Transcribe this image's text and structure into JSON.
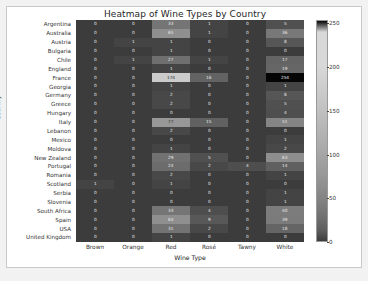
{
  "chart_data": {
    "type": "heatmap",
    "title": "Heatmap of Wine Types by Country",
    "xlabel": "Wine Type",
    "ylabel": "Country",
    "categories_x": [
      "Brown",
      "Orange",
      "Red",
      "Rosé",
      "Tawny",
      "White"
    ],
    "categories_y": [
      "Argentina",
      "Australia",
      "Austria",
      "Bulgaria",
      "Chile",
      "England",
      "France",
      "Georgia",
      "Germany",
      "Greece",
      "Hungary",
      "Italy",
      "Lebanon",
      "Mexico",
      "Moldova",
      "New Zealand",
      "Portugal",
      "Romania",
      "Scotland",
      "Serbia",
      "Slovenia",
      "South Africa",
      "Spain",
      "USA",
      "United Kingdom"
    ],
    "values": [
      [
        0,
        0,
        33,
        1,
        0,
        5
      ],
      [
        0,
        0,
        65,
        1,
        0,
        36
      ],
      [
        0,
        1,
        1,
        0,
        0,
        8
      ],
      [
        0,
        0,
        1,
        0,
        0,
        0
      ],
      [
        0,
        1,
        27,
        1,
        0,
        17
      ],
      [
        0,
        0,
        1,
        0,
        0,
        19
      ],
      [
        0,
        0,
        174,
        16,
        0,
        254
      ],
      [
        0,
        0,
        1,
        0,
        0,
        1
      ],
      [
        0,
        0,
        2,
        0,
        0,
        8
      ],
      [
        0,
        0,
        2,
        0,
        0,
        5
      ],
      [
        0,
        0,
        0,
        0,
        0,
        4
      ],
      [
        0,
        0,
        77,
        15,
        0,
        51
      ],
      [
        0,
        0,
        2,
        0,
        0,
        0
      ],
      [
        0,
        0,
        0,
        0,
        0,
        1
      ],
      [
        0,
        0,
        1,
        0,
        0,
        2
      ],
      [
        0,
        0,
        29,
        5,
        0,
        63
      ],
      [
        0,
        0,
        24,
        2,
        4,
        14
      ],
      [
        0,
        0,
        2,
        0,
        0,
        1
      ],
      [
        1,
        0,
        1,
        0,
        0,
        0
      ],
      [
        0,
        0,
        0,
        0,
        0,
        1
      ],
      [
        0,
        0,
        0,
        0,
        0,
        1
      ],
      [
        0,
        0,
        33,
        4,
        0,
        40
      ],
      [
        0,
        0,
        64,
        9,
        0,
        39
      ],
      [
        0,
        0,
        31,
        2,
        0,
        18
      ],
      [
        0,
        0,
        1,
        0,
        0,
        0
      ]
    ],
    "colorbar": {
      "ticks": [
        0,
        50,
        100,
        150,
        200,
        250
      ],
      "vmin": 0,
      "vmax": 254,
      "colormap": "binary-inverted-dark-high",
      "low_color": "#3a3a3a",
      "high_color": "#000000"
    },
    "grid": false,
    "legend": "colorbar-right"
  }
}
